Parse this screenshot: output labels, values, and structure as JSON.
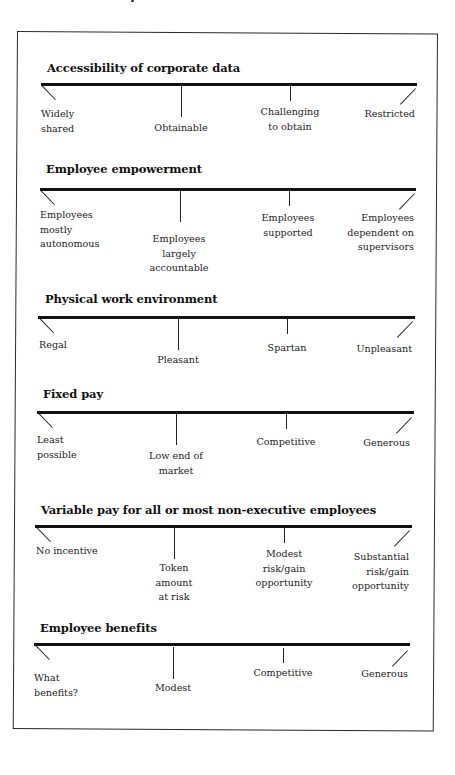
{
  "diagram": {
    "sections": [
      {
        "title": "Accessibility of corporate data",
        "labels": [
          "Widely\nshared",
          "Obtainable",
          "Challenging\nto obtain",
          "Restricted"
        ]
      },
      {
        "title": "Employee empowerment",
        "labels": [
          "Employees\nmostly\nautonomous",
          "Employees\nlargely\naccountable",
          "Employees\nsupported",
          "Employees\ndependent on\nsupervisors"
        ]
      },
      {
        "title": "Physical work environment",
        "labels": [
          "Regal",
          "Pleasant",
          "Spartan",
          "Unpleasant"
        ]
      },
      {
        "title": "Fixed pay",
        "labels": [
          "Least\npossible",
          "Low end of\nmarket",
          "Competitive",
          "Generous"
        ]
      },
      {
        "title": "Variable pay for all or most non-executive employees",
        "labels": [
          "No incentive",
          "Token\namount\nat risk",
          "Modest\nrisk/gain\nopportunity",
          "Substantial\nrisk/gain\nopportunity"
        ]
      },
      {
        "title": "Employee benefits",
        "labels": [
          "What\n benefits?",
          "Modest",
          "Competitive",
          "Generous"
        ]
      }
    ]
  }
}
